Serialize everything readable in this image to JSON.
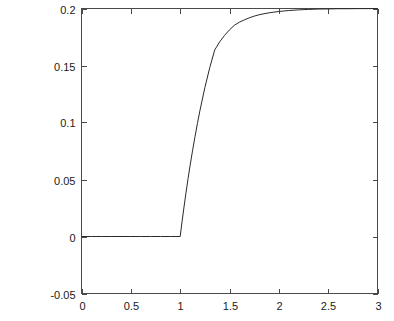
{
  "chart_data": {
    "type": "line",
    "title": "",
    "xlabel": "",
    "ylabel": "",
    "xlim": [
      0,
      3
    ],
    "ylim": [
      -0.05,
      0.2
    ],
    "grid": false,
    "legend": null,
    "xticks": [
      "0",
      "0.5",
      "1",
      "1.5",
      "2",
      "2.5",
      "3"
    ],
    "xtick_values": [
      0,
      0.5,
      1,
      1.5,
      2,
      2.5,
      3
    ],
    "yticks": [
      "-0.05",
      "0",
      "0.05",
      "0.1",
      "0.15",
      "0.2"
    ],
    "ytick_values": [
      -0.05,
      0,
      0.05,
      0.1,
      0.15,
      0.2
    ],
    "series": [
      {
        "name": "response",
        "color": "#2a2a2a",
        "x": [
          0.0,
          0.1,
          0.2,
          0.3,
          0.4,
          0.5,
          0.6,
          0.7,
          0.8,
          0.9,
          1.0,
          1.02,
          1.04,
          1.06,
          1.08,
          1.1,
          1.125,
          1.15,
          1.175,
          1.2,
          1.25,
          1.3,
          1.35,
          1.4,
          1.45,
          1.5,
          1.55,
          1.6,
          1.65,
          1.7,
          1.75,
          1.8,
          1.85,
          1.9,
          1.95,
          2.0,
          2.05,
          2.1,
          2.2,
          2.3,
          2.4,
          2.5,
          2.6,
          2.7,
          2.8,
          2.9,
          3.0
        ],
        "y": [
          0.0,
          0.0,
          0.0,
          0.0,
          0.0,
          0.0,
          0.0,
          0.0,
          0.0,
          0.0,
          0.0,
          0.0136,
          0.0266,
          0.0389,
          0.0507,
          0.0619,
          0.0751,
          0.0875,
          0.0992,
          0.1103,
          0.1305,
          0.1482,
          0.1636,
          0.1707,
          0.1764,
          0.1813,
          0.1853,
          0.188,
          0.19,
          0.1918,
          0.1933,
          0.1945,
          0.1954,
          0.1962,
          0.1968,
          0.1974,
          0.1978,
          0.1982,
          0.1988,
          0.1992,
          0.1995,
          0.1996,
          0.1998,
          0.1998,
          0.1999,
          0.1999,
          0.2
        ]
      }
    ],
    "annotations": [
      "Zero response for x < 1",
      "Step rise at x = 1",
      "Asymptotic approach to 0.2"
    ]
  },
  "axes": {
    "box_color": "#4a4a4a",
    "background": "#ffffff"
  }
}
